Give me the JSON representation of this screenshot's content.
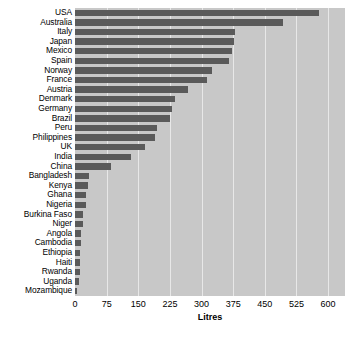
{
  "chart_data": {
    "type": "bar",
    "orientation": "horizontal",
    "title": "",
    "subtitle": "",
    "xlabel": "Litres",
    "ylabel": "",
    "xlim": [
      0,
      640
    ],
    "xticks": [
      0,
      75,
      150,
      225,
      300,
      375,
      450,
      525,
      600
    ],
    "xtick_labels": [
      "0",
      "75",
      "150",
      "225",
      "300",
      "375",
      "450",
      "525",
      "600"
    ],
    "grid": true,
    "grid_axis": "x",
    "legend": false,
    "legend_position": "none",
    "categories": [
      "USA",
      "Australia",
      "Italy",
      "Japan",
      "Mexico",
      "Spain",
      "Norway",
      "France",
      "Austria",
      "Denmark",
      "Germany",
      "Brazil",
      "Peru",
      "Philippines",
      "UK",
      "India",
      "China",
      "Bangladesh",
      "Kenya",
      "Ghana",
      "Nigeria",
      "Burkina Faso",
      "Niger",
      "Angola",
      "Cambodia",
      "Ethiopia",
      "Haiti",
      "Rwanda",
      "Uganda",
      "Mozambique"
    ],
    "values": [
      578,
      493,
      380,
      378,
      373,
      365,
      325,
      313,
      268,
      238,
      230,
      225,
      195,
      190,
      165,
      133,
      86,
      33,
      31,
      26,
      26,
      20,
      19,
      15,
      14,
      13,
      12,
      11,
      10,
      5
    ],
    "colors": {
      "bar": "#5a5a5a",
      "panel_background": "#c8c8c8",
      "gridline": "#e8e8e8",
      "figure_background": "#ffffff",
      "text": "#000000"
    }
  }
}
